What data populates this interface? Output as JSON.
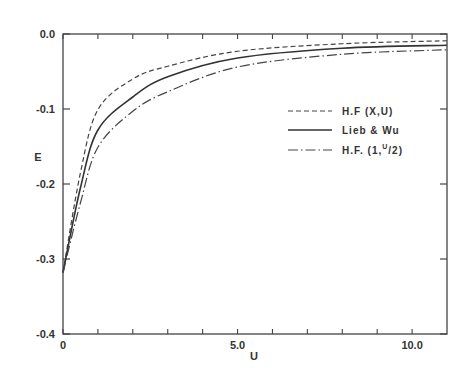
{
  "chart_data": {
    "type": "line",
    "title": "",
    "xlabel": "U",
    "ylabel": "E",
    "xlim": [
      0,
      11
    ],
    "ylim": [
      -0.4,
      0.0
    ],
    "grid": false,
    "legend_position": "upper right (inside)",
    "x_ticks": [
      {
        "value": 0,
        "label": "0"
      },
      {
        "value": 5,
        "label": "5.0"
      },
      {
        "value": 10,
        "label": "10.0"
      }
    ],
    "x_minor_ticks": [
      1,
      2,
      3,
      4,
      6,
      7,
      8,
      9
    ],
    "y_ticks": [
      {
        "value": 0.0,
        "label": "0.0"
      },
      {
        "value": -0.1,
        "label": "-0.1"
      },
      {
        "value": -0.2,
        "label": "-0.2"
      },
      {
        "value": -0.3,
        "label": "-0.3"
      },
      {
        "value": -0.4,
        "label": "-0.4"
      }
    ],
    "x": [
      0,
      0.5,
      1,
      2,
      3,
      5,
      8,
      11
    ],
    "series": [
      {
        "name": "H.F (X,U)",
        "style": "dashed",
        "values": [
          -0.318,
          -0.185,
          -0.101,
          -0.06,
          -0.043,
          -0.023,
          -0.013,
          -0.009
        ]
      },
      {
        "name": "Lieb & Wu",
        "style": "solid",
        "values": [
          -0.318,
          -0.205,
          -0.128,
          -0.084,
          -0.057,
          -0.032,
          -0.019,
          -0.015
        ]
      },
      {
        "name": "H.F. (1,U/2)",
        "style": "dash-dot",
        "values": [
          -0.318,
          -0.225,
          -0.151,
          -0.103,
          -0.077,
          -0.044,
          -0.027,
          -0.021
        ]
      }
    ]
  },
  "legend": {
    "items": [
      {
        "label": "H.F (X,U)"
      },
      {
        "label": "Lieb & Wu"
      },
      {
        "label_main": "H.F. (1,",
        "label_sup": "U",
        "label_end": "/2)"
      }
    ]
  },
  "axes": {
    "xlabel": "U",
    "ylabel": "E"
  }
}
